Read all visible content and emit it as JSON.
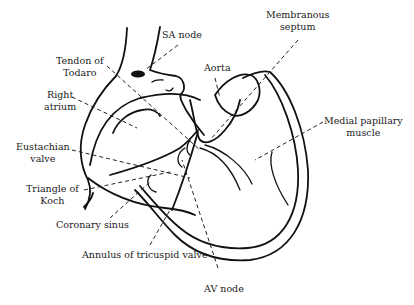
{
  "diagram": {
    "type": "anatomical line drawing",
    "labels": {
      "sa_node": "SA node",
      "membranous_septum_line1": "Membranous",
      "membranous_septum_line2": "septum",
      "tendon_line1": "Tendon of",
      "tendon_line2": "Todaro",
      "aorta": "Aorta",
      "right_atrium_line1": "Right",
      "right_atrium_line2": "atrium",
      "medial_papillary_line1": "Medial papillary",
      "medial_papillary_line2": "muscle",
      "eustachian_line1": "Eustachian",
      "eustachian_line2": "valve",
      "triangle_line1": "Triangle of",
      "triangle_line2": "Koch",
      "coronary_sinus": "Coronary sinus",
      "annulus": "Annulus of tricuspid valve",
      "av_node": "AV node"
    },
    "colors": {
      "ink": "#111111",
      "background": "#ffffff"
    }
  }
}
